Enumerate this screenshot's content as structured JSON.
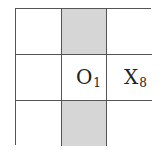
{
  "board": {
    "rows": 3,
    "cols": 3,
    "shade_color": "#d6d6d6",
    "line_color": "#555555",
    "cells": [
      {
        "row": 0,
        "col": 0,
        "shaded": false,
        "symbol": "",
        "index": ""
      },
      {
        "row": 0,
        "col": 1,
        "shaded": true,
        "symbol": "",
        "index": ""
      },
      {
        "row": 0,
        "col": 2,
        "shaded": false,
        "symbol": "",
        "index": ""
      },
      {
        "row": 1,
        "col": 0,
        "shaded": false,
        "symbol": "",
        "index": ""
      },
      {
        "row": 1,
        "col": 1,
        "shaded": false,
        "symbol": "O",
        "index": "1"
      },
      {
        "row": 1,
        "col": 2,
        "shaded": false,
        "symbol": "X",
        "index": "8"
      },
      {
        "row": 2,
        "col": 0,
        "shaded": false,
        "symbol": "",
        "index": ""
      },
      {
        "row": 2,
        "col": 1,
        "shaded": true,
        "symbol": "",
        "index": ""
      },
      {
        "row": 2,
        "col": 2,
        "shaded": false,
        "symbol": "",
        "index": ""
      }
    ]
  }
}
